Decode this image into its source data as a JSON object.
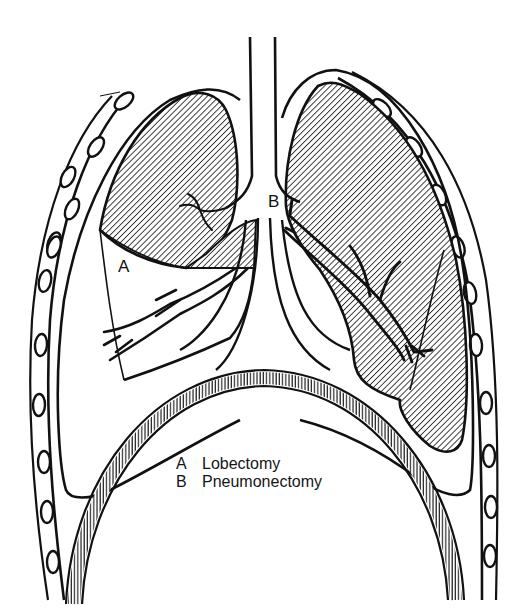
{
  "figure": {
    "type": "anatomical line drawing",
    "labels": {
      "a": "A",
      "b": "B"
    },
    "legend": [
      {
        "key": "A",
        "text": "Lobectomy"
      },
      {
        "key": "B",
        "text": "Pneumonectomy"
      }
    ],
    "colors": {
      "ink": "#111111",
      "background": "#ffffff",
      "hatch": "#2a2a2a"
    }
  }
}
